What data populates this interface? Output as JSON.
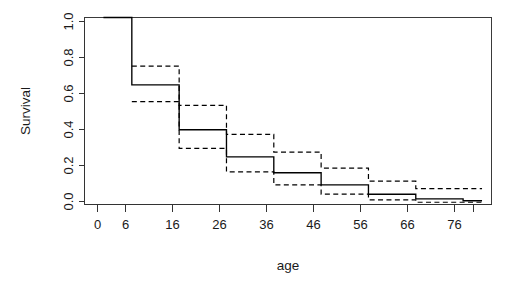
{
  "chart_data": {
    "type": "line",
    "title": "",
    "subtitle": "",
    "xlabel": "age",
    "ylabel": "Survival",
    "xlim": [
      -4,
      82
    ],
    "ylim": [
      0.0,
      1.0
    ],
    "grid": false,
    "legend": null,
    "x_ticks": [
      0,
      6,
      16,
      26,
      36,
      46,
      56,
      66,
      76
    ],
    "x_tick_labels": [
      "0",
      "6",
      "16",
      "26",
      "36",
      "46",
      "56",
      "66",
      "76"
    ],
    "y_ticks": [
      0.0,
      0.2,
      0.4,
      0.6,
      0.8,
      1.0
    ],
    "y_tick_labels": [
      "0.0",
      "0.2",
      "0.4",
      "0.6",
      "0.8",
      "1.0"
    ],
    "step_times": [
      0,
      6,
      16,
      26,
      36,
      46,
      56,
      66,
      76,
      80
    ],
    "series": [
      {
        "name": "Survival estimate",
        "style": "solid",
        "values": [
          1.0,
          0.64,
          0.4,
          0.255,
          0.17,
          0.105,
          0.055,
          0.03,
          0.02,
          0.02
        ]
      },
      {
        "name": "Upper confidence limit",
        "style": "dashed",
        "values": [
          1.0,
          0.74,
          0.53,
          0.375,
          0.28,
          0.195,
          0.125,
          0.085,
          0.085,
          0.085
        ]
      },
      {
        "name": "Lower confidence limit",
        "style": "dashed",
        "values": [
          1.0,
          0.55,
          0.3,
          0.175,
          0.105,
          0.055,
          0.025,
          0.012,
          0.012,
          0.012
        ]
      }
    ],
    "annotations": []
  },
  "axes": {
    "y_title": "Survival",
    "x_title": "age"
  }
}
